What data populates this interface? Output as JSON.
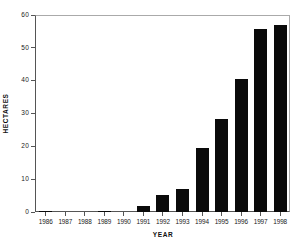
{
  "chart_data": {
    "type": "bar",
    "title": "",
    "xlabel": "YEAR",
    "ylabel": "HECTARES",
    "categories": [
      "1986",
      "1987",
      "1988",
      "1989",
      "1990",
      "1991",
      "1992",
      "1993",
      "1994",
      "1995",
      "1996",
      "1997",
      "1998"
    ],
    "values": [
      0.2,
      0,
      0,
      0.4,
      0,
      1.8,
      5.1,
      7.1,
      19.6,
      28.2,
      40.4,
      55.7,
      57.0
    ],
    "ylim": [
      0,
      60
    ],
    "yticks": [
      0,
      10,
      20,
      30,
      40,
      50,
      60
    ],
    "ytick_labels": [
      "0",
      "10",
      "20",
      "30",
      "40",
      "50",
      "60"
    ],
    "grid": false,
    "legend": null,
    "bar_color": "#0a0a0a",
    "axis_color": "#555555",
    "background": "#ffffff"
  }
}
